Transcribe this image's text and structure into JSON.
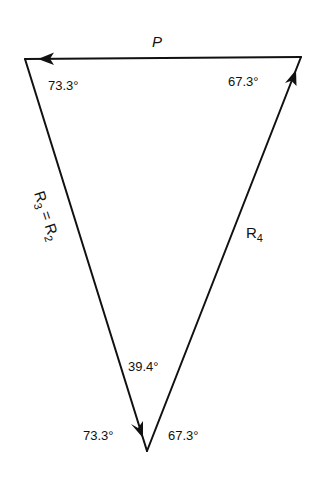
{
  "diagram": {
    "type": "force-triangle",
    "vectors": [
      {
        "id": "P",
        "label": "P",
        "from": "top-right",
        "to": "top-left"
      },
      {
        "id": "R4",
        "label": "R",
        "subscript": "4",
        "from": "bottom",
        "to": "top-right"
      },
      {
        "id": "R3",
        "label_left": "R",
        "sub_left": "3",
        "equals": " = ",
        "label_right": "R",
        "sub_right": "2",
        "from": "top-left",
        "to": "bottom"
      }
    ],
    "angles": {
      "top_left": "73.3°",
      "top_right": "67.3°",
      "bottom_interior": "39.4°",
      "bottom_left": "73.3°",
      "bottom_right": "67.3°"
    },
    "colors": {
      "ink": "#111111",
      "background": "#ffffff"
    }
  }
}
